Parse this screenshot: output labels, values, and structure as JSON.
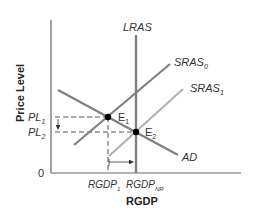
{
  "diagram": {
    "type": "AD-AS model",
    "axes": {
      "y_label": "Price Level",
      "x_label": "RGDP",
      "origin_label": "0"
    },
    "curves": {
      "lras": {
        "label": "LRAS"
      },
      "sras0": {
        "label": "SRAS",
        "sub": "0"
      },
      "sras1": {
        "label": "SRAS",
        "sub": "1"
      },
      "ad": {
        "label": "AD"
      }
    },
    "points": {
      "e1": {
        "label": "E",
        "sub": "1"
      },
      "e2": {
        "label": "E",
        "sub": "2"
      }
    },
    "y_ticks": {
      "pl1": {
        "label": "PL",
        "sub": "1"
      },
      "pl2": {
        "label": "PL",
        "sub": "2"
      }
    },
    "x_ticks": {
      "rgdp1": {
        "label": "RGDP",
        "sub": "1"
      },
      "rgdpnr": {
        "label": "RGDP",
        "sub": "NR"
      }
    },
    "colors": {
      "axis": "#666666",
      "lras": "#808080",
      "sras0": "#808080",
      "sras1": "#b0b0b0",
      "ad": "#808080",
      "point": "#000000",
      "dashed": "#555555"
    }
  }
}
